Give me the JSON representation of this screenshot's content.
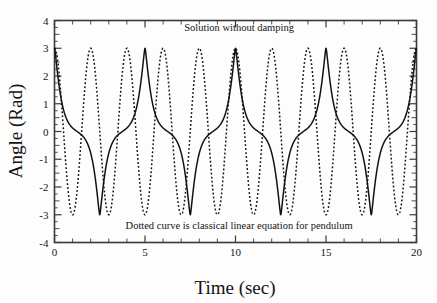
{
  "chart_data": {
    "type": "line",
    "title": "",
    "xlabel": "Time (sec)",
    "ylabel": "Angle (Rad)",
    "xlim": [
      0,
      20
    ],
    "ylim": [
      -4,
      4
    ],
    "xticks": [
      0,
      5,
      10,
      15,
      20
    ],
    "yticks": [
      -4,
      -3,
      -2,
      -1,
      0,
      1,
      2,
      3,
      4
    ],
    "xtick_labels": [
      "0",
      "5",
      "10",
      "15",
      "20"
    ],
    "ytick_labels": [
      "-4",
      "-3",
      "-2",
      "-1",
      "0",
      "1",
      "2",
      "3",
      "4"
    ],
    "x_minor_interval": 1,
    "y_minor_interval": 0.25,
    "grid": false,
    "legend": "none",
    "annotations": [
      {
        "name": "top-annotation",
        "text": "Solution without damping",
        "x": 10.2,
        "y": 3.62
      },
      {
        "name": "bottom-annotation",
        "text": "Dotted curve is classical linear equation for pendulum",
        "x": 10.2,
        "y": -3.52
      }
    ],
    "series": [
      {
        "name": "Nonlinear pendulum solution (solid)",
        "style": "solid",
        "color": "#121212",
        "amplitude": 3.0,
        "period": 5.0,
        "phase_deg": 0,
        "description": "Exact nonlinear pendulum with theta0 = 3 rad; flattened peaks and troughs, period about 5 sec",
        "peaks_t": [
          0,
          5,
          10,
          15,
          20
        ],
        "peaks_y": [
          3,
          3,
          3,
          3,
          3
        ],
        "troughs_t": [
          2.5,
          7.5,
          12.5,
          17.5
        ],
        "troughs_y": [
          -3,
          -3,
          -3,
          -3
        ]
      },
      {
        "name": "Classical linear equation for pendulum (dotted)",
        "style": "dotted",
        "color": "#121212",
        "amplitude": 3.0,
        "period": 2.0,
        "phase_deg": 0,
        "description": "Linear small-angle approximation, theta = 3 cos(pi t), period 2 sec",
        "peaks_t": [
          0,
          2,
          4,
          6,
          8,
          10,
          12,
          14,
          16,
          18,
          20
        ],
        "peaks_y": [
          3,
          3,
          3,
          3,
          3,
          3,
          3,
          3,
          3,
          3,
          3
        ],
        "troughs_t": [
          1,
          3,
          5,
          7,
          9,
          11,
          13,
          15,
          17,
          19
        ],
        "troughs_y": [
          -3,
          -3,
          -3,
          -3,
          -3,
          -3,
          -3,
          -3,
          -3,
          -3
        ]
      }
    ]
  },
  "figure": {
    "background": "#fdfdfd",
    "axis_color": "#3a3a3a",
    "ink_color": "#121212"
  }
}
